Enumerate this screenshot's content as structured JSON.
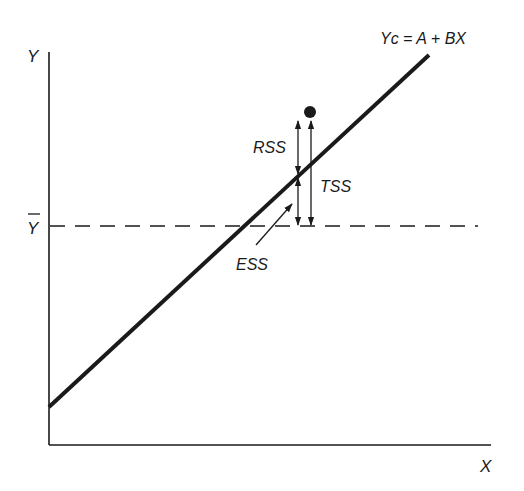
{
  "diagram": {
    "axes": {
      "y_label": "Y",
      "x_label": "X",
      "mean_label": "Y"
    },
    "regression_line": {
      "equation": "Yc = A + BX"
    },
    "segments": {
      "rss_label": "RSS",
      "tss_label": "TSS",
      "ess_label": "ESS"
    },
    "colors": {
      "ink": "#1a1a1a",
      "background": "#ffffff"
    }
  }
}
